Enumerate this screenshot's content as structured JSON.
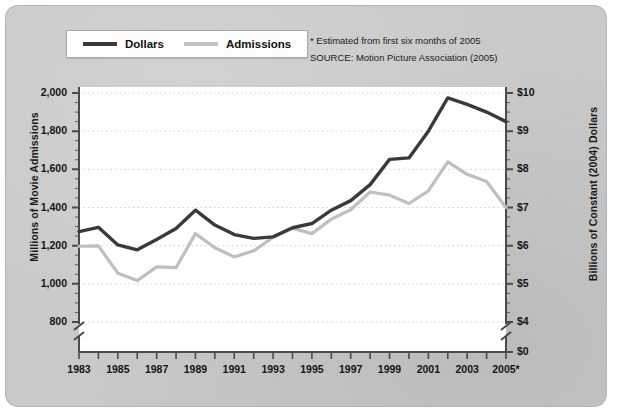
{
  "chart_data": {
    "type": "line",
    "title": "",
    "subtitle": "",
    "xlabel": "",
    "ylabel": "Millions of Movie Admissions",
    "ylabel_right": "Billions of Constant (2004) Dollars",
    "grid": true,
    "legend_position": "top-left",
    "x": [
      "1983",
      "1984",
      "1985",
      "1986",
      "1987",
      "1988",
      "1989",
      "1990",
      "1991",
      "1992",
      "1993",
      "1994",
      "1995",
      "1996",
      "1997",
      "1998",
      "1999",
      "2000",
      "2001",
      "2002",
      "2003",
      "2004",
      "2005*"
    ],
    "x_tick_labels": [
      "1983",
      "1985",
      "1987",
      "1989",
      "1991",
      "1993",
      "1995",
      "1997",
      "1999",
      "2001",
      "2003",
      "2005*"
    ],
    "ylim": [
      800,
      2000
    ],
    "y_tick_labels": [
      "2,000",
      "1,800",
      "1,600",
      "1,400",
      "1,200",
      "1,000",
      "800"
    ],
    "y_tick_values": [
      2000,
      1800,
      1600,
      1400,
      1200,
      1000,
      800
    ],
    "y_axis_break_below": 800,
    "ylim_right": [
      4,
      10
    ],
    "y_right_tick_labels": [
      "$10",
      "$9",
      "$8",
      "$7",
      "$6",
      "$5",
      "$4",
      "$0"
    ],
    "y_right_tick_values": [
      10,
      9,
      8,
      7,
      6,
      5,
      4,
      0
    ],
    "y_right_axis_break": true,
    "series": [
      {
        "name": "Dollars",
        "color": "#3a3a3a",
        "axis": "right",
        "values_right_axis": [
          6.37,
          6.48,
          6.02,
          5.89,
          6.16,
          6.45,
          6.93,
          6.54,
          6.29,
          6.19,
          6.23,
          6.47,
          6.58,
          6.93,
          7.18,
          7.6,
          8.26,
          8.3,
          9.0,
          9.87,
          9.7,
          9.5,
          9.25
        ],
        "values_left_scale": [
          1272,
          1295,
          1205,
          1178,
          1232,
          1290,
          1386,
          1307,
          1258,
          1238,
          1245,
          1293,
          1316,
          1385,
          1435,
          1519,
          1652,
          1660,
          1800,
          1974,
          1940,
          1900,
          1850
        ]
      },
      {
        "name": "Admissions",
        "color": "#bfbfbf",
        "axis": "left",
        "values": [
          1197,
          1199,
          1056,
          1017,
          1089,
          1085,
          1263,
          1189,
          1141,
          1173,
          1244,
          1292,
          1263,
          1339,
          1388,
          1481,
          1465,
          1421,
          1487,
          1639,
          1574,
          1536,
          1400
        ]
      }
    ],
    "annotations": [
      "* Estimated from first six months of 2005",
      "SOURCE: Motion Picture Association  (2005)"
    ]
  },
  "legend": {
    "items": [
      {
        "label": "Dollars",
        "color": "#3a3a3a"
      },
      {
        "label": "Admissions",
        "color": "#c2c2c2"
      }
    ]
  },
  "notes": {
    "line1": "* Estimated from first six months of 2005",
    "line2": "SOURCE: Motion Picture Association  (2005)"
  },
  "axes": {
    "left_title": "Millions of Movie Admissions",
    "right_title": "Billions of Constant (2004) Dollars"
  },
  "colors": {
    "panel_background": "#c9c9c9",
    "plot_background": "#ffffff",
    "dollars_line": "#3a3a3a",
    "admissions_line": "#bfbfbf",
    "grid": "#cfcfcf",
    "axis": "#4a4a4a"
  }
}
